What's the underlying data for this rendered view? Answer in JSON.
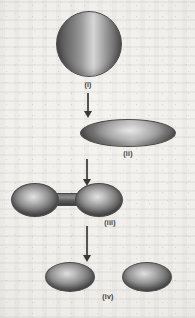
{
  "figure": {
    "background_color": "#f2f1ee",
    "outline_color": "#4a4a4a",
    "arrow_color": "#3b3937",
    "caption_color": "#3c3a38"
  },
  "stages": [
    {
      "id": "i",
      "label": "(i)",
      "shape": "sphere",
      "description": "Spherical nucleus in its ground state",
      "x": 88,
      "y": 85
    },
    {
      "id": "ii",
      "label": "(ii)",
      "shape": "oblate-ellipsoid",
      "description": "Nucleus deformed into a flattened ellipsoid",
      "x": 128,
      "y": 153
    },
    {
      "id": "iii",
      "label": "(iii)",
      "shape": "dumbbell",
      "description": "Nucleus elongated into a dumbbell with a narrow neck",
      "x": 110,
      "y": 222
    },
    {
      "id": "iv",
      "label": "(iv)",
      "shape": "two-fragments",
      "description": "Neck breaks and two separate fission fragments form",
      "x": 108,
      "y": 296
    }
  ],
  "arrows": [
    {
      "id": "arrow-i-to-ii",
      "from": "i",
      "to": "ii",
      "direction": "down"
    },
    {
      "id": "arrow-ii-to-iii",
      "from": "ii",
      "to": "iii",
      "direction": "down"
    },
    {
      "id": "arrow-iii-to-iv",
      "from": "iii",
      "to": "iv",
      "direction": "down"
    }
  ]
}
